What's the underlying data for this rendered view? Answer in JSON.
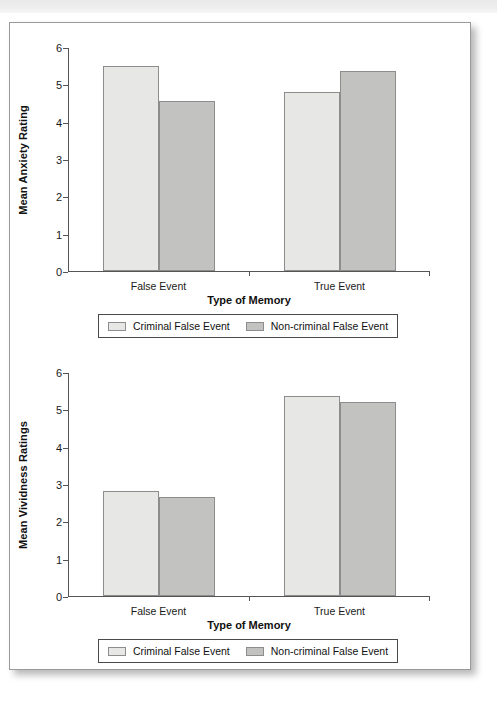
{
  "page": {
    "background_color": "#ffffff",
    "border_color": "#9a9a9a",
    "top_band_color": "#e9e9e9"
  },
  "colors": {
    "series_light": "#e7e7e5",
    "series_dark": "#c2c2c0",
    "axis": "#555555",
    "text": "#111111"
  },
  "legend": {
    "items": [
      {
        "label": "Criminal False Event",
        "swatch": "light"
      },
      {
        "label": "Non-criminal False Event",
        "swatch": "dark"
      }
    ]
  },
  "chart_data": [
    {
      "type": "bar",
      "title": "",
      "xlabel": "Type of Memory",
      "ylabel": "Mean Anxiety Rating",
      "categories": [
        "False Event",
        "True Event"
      ],
      "ylim": [
        0,
        6
      ],
      "yticks": [
        0,
        1,
        2,
        3,
        4,
        5,
        6
      ],
      "ytick_labels": [
        "0",
        "1",
        "2",
        "3",
        "4",
        "5",
        "6"
      ],
      "grid": false,
      "legend_position": "bottom",
      "series": [
        {
          "name": "Criminal False Event",
          "values": [
            5.5,
            4.8
          ]
        },
        {
          "name": "Non-criminal False Event",
          "values": [
            4.55,
            5.35
          ]
        }
      ]
    },
    {
      "type": "bar",
      "title": "",
      "xlabel": "Type of Memory",
      "ylabel": "Mean Vividness Ratings",
      "categories": [
        "False Event",
        "True Event"
      ],
      "ylim": [
        0,
        6
      ],
      "yticks": [
        0,
        1,
        2,
        3,
        4,
        5,
        6
      ],
      "ytick_labels": [
        "0",
        "1",
        "2",
        "3",
        "4",
        "5",
        "6"
      ],
      "grid": false,
      "legend_position": "bottom",
      "series": [
        {
          "name": "Criminal False Event",
          "values": [
            2.8,
            5.35
          ]
        },
        {
          "name": "Non-criminal False Event",
          "values": [
            2.65,
            5.2
          ]
        }
      ]
    }
  ]
}
